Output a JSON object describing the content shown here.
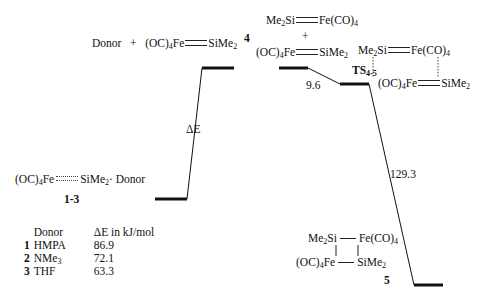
{
  "diagram": {
    "type": "energy-profile",
    "units": "kJ/mol",
    "states": [
      {
        "id": "1-3",
        "label": "1-3",
        "formula": "(OC)4Fe····SiMe2·Donor"
      },
      {
        "id": "4",
        "label": "4",
        "formula_left": "Donor + (OC)4Fe=SiMe2",
        "formula_right_top": "Me2Si=Fe(CO)4",
        "plus": "+",
        "formula_right_bottom": "(OC)4Fe=SiMe2"
      },
      {
        "id": "TS",
        "label": "TS",
        "label_sub": "4-5",
        "formula_top": "Me2Si=Fe(CO)4",
        "formula_bottom": "(OC)4Fe=SiMe2"
      },
      {
        "id": "5",
        "label": "5",
        "formula_top": "Me2Si—Fe(CO)4",
        "formula_bottom": "(OC)4Fe—SiMe2"
      }
    ],
    "transitions": [
      {
        "from": "1-3",
        "to": "4",
        "label": "ΔE"
      },
      {
        "from": "4",
        "to": "TS",
        "label": "9.6"
      },
      {
        "from": "TS",
        "to": "5",
        "label": "129.3"
      }
    ],
    "table": {
      "headers": [
        "Donor",
        "ΔE in kJ/mol"
      ],
      "rows": [
        {
          "num": "1",
          "donor": "HMPA",
          "value": "86.9"
        },
        {
          "num": "2",
          "donor": "NMe",
          "donor_sub": "3",
          "value": "72.1"
        },
        {
          "num": "3",
          "donor": "THF",
          "value": "63.3"
        }
      ]
    }
  },
  "text": {
    "donor": "Donor",
    "plus": "+",
    "oc": "(OC)",
    "sub4": "4",
    "sub2": "2",
    "fe": "Fe",
    "sime": "SiMe",
    "me": "Me",
    "si": "Si",
    "feco": "Fe(CO)",
    "dot_donor": "· Donor",
    "label_13": "1-3",
    "label_4": "4",
    "label_ts": "TS",
    "label_ts_sub": "4-5",
    "label_5": "5",
    "delta_e": "ΔE",
    "val_96": "9.6",
    "val_1293": "129.3"
  }
}
